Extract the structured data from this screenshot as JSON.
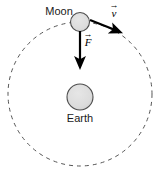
{
  "figure": {
    "background_color": "#ffffff",
    "width": 162,
    "height": 173
  },
  "orbit": {
    "name": "orbit-path",
    "style": "dashed",
    "center_x": 80,
    "center_y": 94,
    "radius": 72,
    "stroke_color": "#555555",
    "stroke_width": 1,
    "dash_pattern": "4 4"
  },
  "bodies": [
    {
      "id": "moon",
      "label": "Moon",
      "center_x": 80,
      "center_y": 22,
      "radius": 9.5,
      "fill_color": "#d9d9d9",
      "stroke_color": "#4d4d4d",
      "label_x": 59,
      "label_y": 15
    },
    {
      "id": "earth",
      "label": "Earth",
      "center_x": 80,
      "center_y": 97,
      "radius": 13,
      "fill_color": "#d9d9d9",
      "stroke_color": "#4d4d4d",
      "label_x": 80,
      "label_y": 122
    }
  ],
  "vectors": [
    {
      "id": "force",
      "symbol": "F",
      "accent": "→",
      "description": "gravitational force on Moon directed toward Earth",
      "start_x": 80,
      "start_y": 31,
      "end_x": 80,
      "end_y": 67,
      "label_x": 88,
      "label_y": 45,
      "color": "#000000",
      "stroke_width": 2.2
    },
    {
      "id": "velocity",
      "symbol": "v",
      "accent": "→",
      "description": "orbital velocity of Moon tangent to orbit",
      "start_x": 90,
      "start_y": 20,
      "end_x": 120,
      "end_y": 32,
      "label_x": 114,
      "label_y": 14,
      "color": "#000000",
      "stroke_width": 2.2
    }
  ]
}
